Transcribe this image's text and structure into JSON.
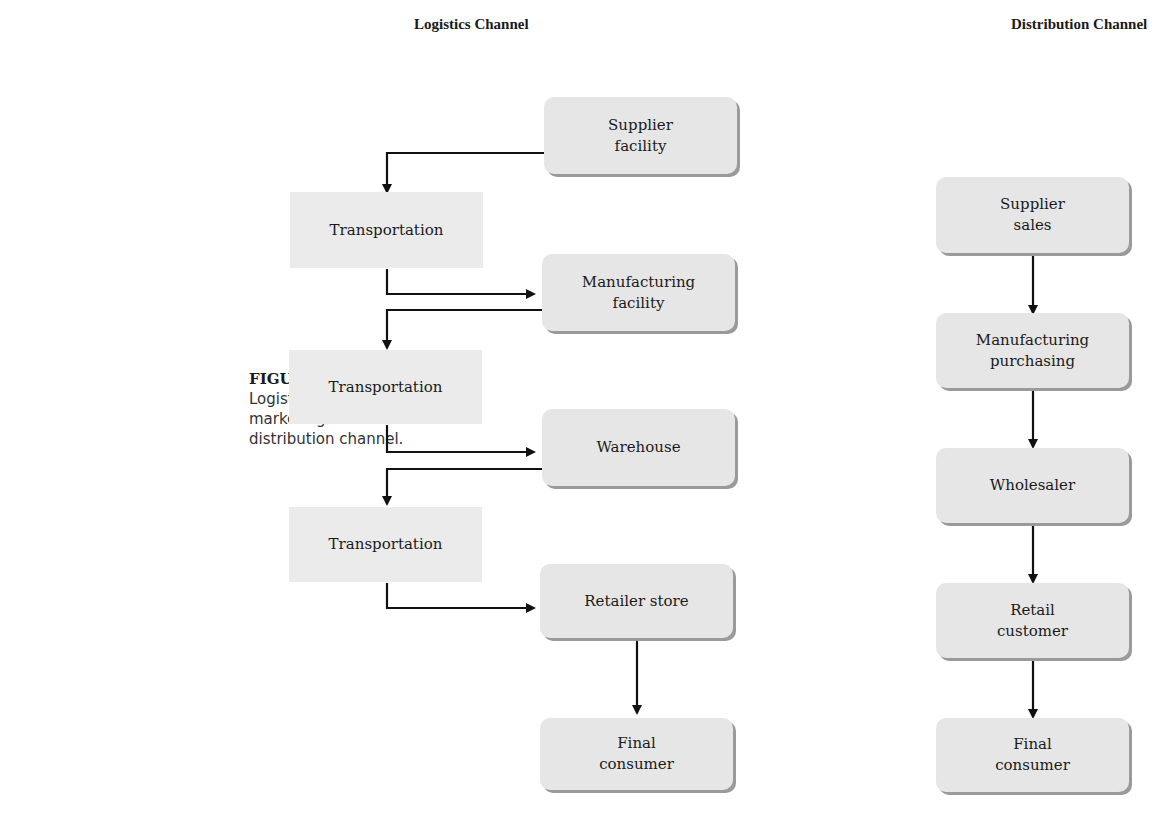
{
  "caption": {
    "figure": "FIGURE 4.8",
    "text": "Logistics versus marketing distribution channel."
  },
  "logistics": {
    "title": "Logistics Channel",
    "nodes": [
      {
        "id": "supplier_facility",
        "label": "Supplier facility",
        "shape": "rounded"
      },
      {
        "id": "transport1",
        "label": "Transportation",
        "shape": "flat"
      },
      {
        "id": "manufacturing_facility",
        "label": "Manufacturing facility",
        "shape": "rounded"
      },
      {
        "id": "transport2",
        "label": "Transportation",
        "shape": "flat"
      },
      {
        "id": "warehouse",
        "label": "Warehouse",
        "shape": "rounded"
      },
      {
        "id": "transport3",
        "label": "Transportation",
        "shape": "flat"
      },
      {
        "id": "retailer_store",
        "label": "Retailer store",
        "shape": "rounded"
      },
      {
        "id": "final_consumer",
        "label": "Final consumer",
        "shape": "rounded"
      }
    ]
  },
  "distribution": {
    "title": "Distribution Channel",
    "nodes": [
      {
        "id": "supplier_sales",
        "label": "Supplier sales"
      },
      {
        "id": "manufacturing_purchasing",
        "label": "Manufacturing purchasing"
      },
      {
        "id": "wholesaler",
        "label": "Wholesaler"
      },
      {
        "id": "retail_customer",
        "label": "Retail customer"
      },
      {
        "id": "final_consumer",
        "label": "Final consumer"
      }
    ]
  }
}
